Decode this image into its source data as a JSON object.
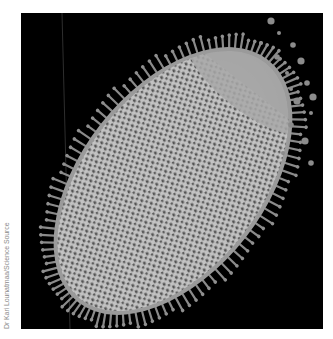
{
  "figure": {
    "background_color": "#000000",
    "page_background": "#ffffff",
    "cell_colors": {
      "cytoplasm_light": "#c9c9c9",
      "granule_dark": "#4a4a4a",
      "membrane": "#a8a8a8",
      "projection": "#8f8f8f"
    }
  },
  "credit": {
    "text": "Dr Kari Lounatmaa/Science Source"
  }
}
